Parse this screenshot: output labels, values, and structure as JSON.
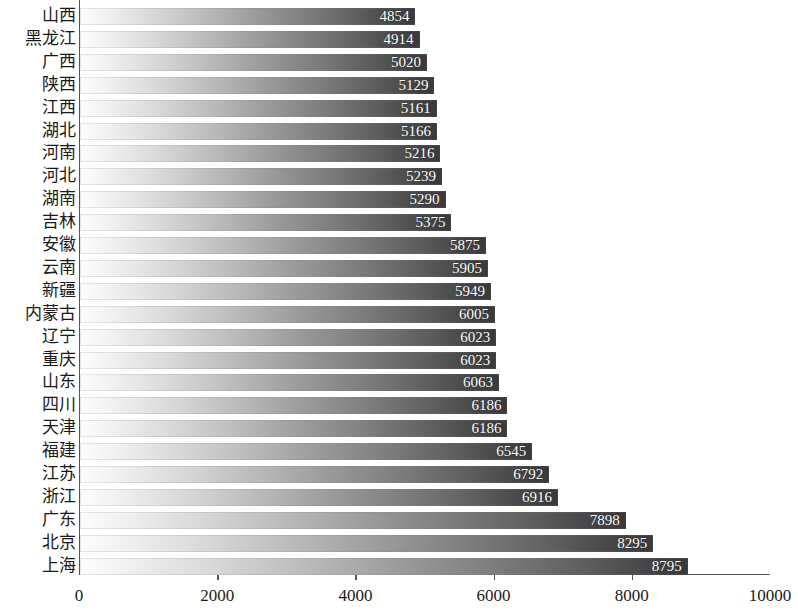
{
  "chart_data": {
    "type": "bar",
    "orientation": "horizontal",
    "title": "",
    "subtitle": "",
    "xlabel": "",
    "ylabel": "",
    "xlim": [
      0,
      10000
    ],
    "xticks": [
      "0",
      "2000",
      "4000",
      "6000",
      "8000",
      "10000"
    ],
    "xtick_values": [
      0,
      2000,
      4000,
      6000,
      8000,
      10000
    ],
    "grid": false,
    "legend": null,
    "categories": [
      "山西",
      "黑龙江",
      "广西",
      "陕西",
      "江西",
      "湖北",
      "河南",
      "河北",
      "湖南",
      "吉林",
      "安徽",
      "云南",
      "新疆",
      "内蒙古",
      "辽宁",
      "重庆",
      "山东",
      "四川",
      "天津",
      "福建",
      "江苏",
      "浙江",
      "广东",
      "北京",
      "上海"
    ],
    "values": [
      4854,
      4914,
      5020,
      5129,
      5161,
      5166,
      5216,
      5239,
      5290,
      5375,
      5875,
      5905,
      5949,
      6005,
      6023,
      6023,
      6063,
      6186,
      6186,
      6545,
      6792,
      6916,
      7898,
      8295,
      8795
    ],
    "value_labels": [
      "4854",
      "4914",
      "5020",
      "5129",
      "5161",
      "5166",
      "5216",
      "5239",
      "5290",
      "5375",
      "5875",
      "5905",
      "5949",
      "6005",
      "6023",
      "6023",
      "6063",
      "6186",
      "6186",
      "6545",
      "6792",
      "6916",
      "7898",
      "8295",
      "8795"
    ],
    "colors": {
      "bar_gradient_start": "#fdfdfd",
      "bar_gradient_end": "#39393b",
      "axis": "#55555a",
      "value_label": "#ffffff",
      "tick_label": "#1a1a1a",
      "background": "#ffffff"
    }
  }
}
